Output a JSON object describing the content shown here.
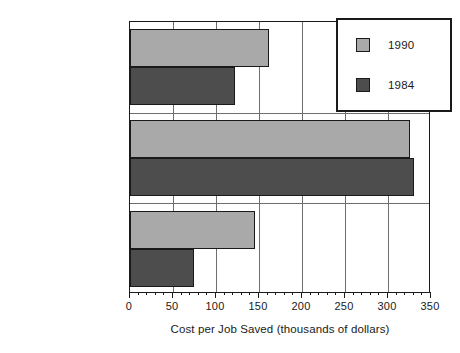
{
  "chart_data": {
    "type": "bar",
    "orientation": "horizontal",
    "title": "",
    "xlabel": "Cost per Job Saved (thousands of dollars)",
    "ylabel": "",
    "categories": [
      "Total",
      "All Other Sectors",
      "Textiles and Apparel"
    ],
    "series": [
      {
        "name": "1990",
        "color": "#a9a9a9",
        "values": [
          162,
          325,
          145
        ]
      },
      {
        "name": "1984",
        "color": "#4d4d4d",
        "values": [
          122,
          330,
          74
        ]
      }
    ],
    "xlim": [
      0,
      350
    ],
    "xticks": [
      0,
      50,
      100,
      150,
      200,
      250,
      300,
      350
    ],
    "xtick_labels": [
      "0",
      "50",
      "100",
      "150",
      "200",
      "250",
      "300",
      "350"
    ],
    "minor_tick_interval": 10,
    "grid": {
      "vertical": true,
      "horizontal": "category-separators"
    },
    "legend": {
      "position": "top-right",
      "entries": [
        {
          "label": "1990",
          "color": "#a9a9a9"
        },
        {
          "label": "1984",
          "color": "#4d4d4d"
        }
      ]
    },
    "colors": {
      "series_1990": "#a9a9a9",
      "series_1984": "#4d4d4d",
      "axis": "#1a1a1a",
      "grid": "#6e6e6e",
      "background": "#ffffff"
    }
  }
}
